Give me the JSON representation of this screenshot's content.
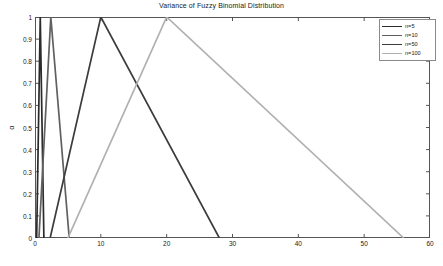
{
  "chart_data": {
    "type": "line",
    "title": "Variance of Fuzzy Binomial Distribution",
    "xlabel": "",
    "ylabel": "α",
    "xlim": [
      0,
      60
    ],
    "ylim": [
      0,
      1
    ],
    "xticks": [
      0,
      10,
      20,
      30,
      40,
      50,
      60
    ],
    "yticks": [
      0,
      0.1,
      0.2,
      0.3,
      0.4,
      0.5,
      0.6,
      0.7,
      0.8,
      0.9,
      1
    ],
    "xticklabels": [
      "0",
      "10",
      "20",
      "30",
      "40",
      "50",
      "60"
    ],
    "yticklabels": [
      "0",
      "0.1",
      "0.2",
      "0.3",
      "0.4",
      "0.5",
      "0.6",
      "0.7",
      "0.8",
      "0.9",
      "1"
    ],
    "grid": false,
    "legend_position": "upper right",
    "series": [
      {
        "name": "n=5",
        "color": "#2b2b2b",
        "x": [
          0.25,
          0.8,
          1.35
        ],
        "y": [
          0,
          1,
          0
        ]
      },
      {
        "name": "n=10",
        "color": "#606060",
        "x": [
          0.6,
          2.4,
          5.2
        ],
        "y": [
          0,
          1,
          0
        ]
      },
      {
        "name": "n=50",
        "color": "#3c3c3c",
        "x": [
          2.3,
          10,
          28
        ],
        "y": [
          0,
          1,
          0
        ]
      },
      {
        "name": "n=100",
        "color": "#b0b0b0",
        "x": [
          5,
          20,
          56
        ],
        "y": [
          0,
          1,
          0
        ]
      }
    ]
  },
  "legend": {
    "entries": [
      {
        "label": "n=5"
      },
      {
        "label": "n=10"
      },
      {
        "label": "n=50"
      },
      {
        "label": "n=100"
      }
    ]
  }
}
